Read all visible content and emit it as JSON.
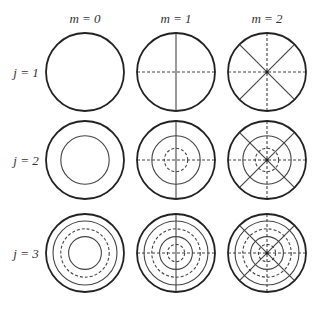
{
  "columns": [
    {
      "label": "m = 0",
      "cx": 85,
      "m": 0
    },
    {
      "label": "m = 1",
      "cx": 176,
      "m": 1
    },
    {
      "label": "m = 2",
      "cx": 267,
      "m": 2
    }
  ],
  "rows": [
    {
      "label": "j = 1",
      "cy": 72,
      "j": 1
    },
    {
      "label": "j = 2",
      "cy": 160,
      "j": 2
    },
    {
      "label": "j = 3",
      "cy": 253,
      "j": 3
    }
  ],
  "radius": 39,
  "rings": {
    "1": [],
    "2": [
      {
        "r": 0.62,
        "dashed": false
      },
      {
        "r": 0.3,
        "dashed": true
      }
    ],
    "3": [
      {
        "r": 0.82,
        "dashed": false
      },
      {
        "r": 0.62,
        "dashed": true
      },
      {
        "r": 0.42,
        "dashed": false
      },
      {
        "r": 0.22,
        "dashed": true
      }
    ]
  },
  "colors": {
    "stroke": "#222222",
    "inner": "#444444"
  }
}
